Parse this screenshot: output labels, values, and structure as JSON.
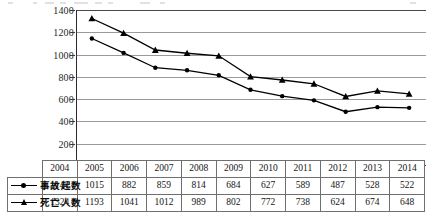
{
  "chart_data": {
    "type": "line",
    "title": "",
    "xlabel": "",
    "ylabel": "",
    "categories": [
      "2004",
      "2005",
      "2006",
      "2007",
      "2008",
      "2009",
      "2010",
      "2011",
      "2012",
      "2013",
      "2014"
    ],
    "series": [
      {
        "name": "事故起数",
        "marker": "circle",
        "color": "#000000",
        "values": [
          1144,
          1015,
          882,
          859,
          814,
          684,
          627,
          589,
          487,
          528,
          522
        ]
      },
      {
        "name": "死亡人数",
        "marker": "triangle",
        "color": "#000000",
        "values": [
          1324,
          1193,
          1041,
          1012,
          989,
          802,
          772,
          738,
          624,
          674,
          648
        ]
      }
    ],
    "ylim": [
      0,
      1400
    ],
    "ytick_step": 200,
    "yticks": [
      "1400",
      "1200",
      "1000",
      "800",
      "600",
      "400",
      "200",
      "0"
    ],
    "grid": true,
    "legend_position": "table-left-column"
  },
  "table": {
    "header_corner": "",
    "columns": [
      "2004",
      "2005",
      "2006",
      "2007",
      "2008",
      "2009",
      "2010",
      "2011",
      "2012",
      "2013",
      "2014"
    ],
    "rows": [
      {
        "label": "事故起数",
        "marker": "circle-line-marker",
        "values": [
          "1144",
          "1015",
          "882",
          "859",
          "814",
          "684",
          "627",
          "589",
          "487",
          "528",
          "522"
        ]
      },
      {
        "label": "死亡人数",
        "marker": "triangle-line-marker",
        "values": [
          "1324",
          "1193",
          "1041",
          "1012",
          "989",
          "802",
          "772",
          "738",
          "624",
          "674",
          "648"
        ]
      }
    ]
  },
  "colors": {
    "series_line": "#000000",
    "gridline": "#9a9a9a",
    "axis": "#2a2a2a",
    "table_border": "#6f6f6f",
    "text": "#141414"
  }
}
